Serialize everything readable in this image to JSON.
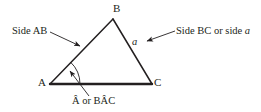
{
  "figure": {
    "name": "labelled-triangle-abc",
    "background_color": "#ffffff",
    "stroke_color": "#231f20",
    "vertices": {
      "a_label": "A",
      "b_label": "B",
      "c_label": "C"
    },
    "callouts": {
      "side_ab": "Side AB",
      "side_bc_prefix": "Side BC or side ",
      "side_bc_variable": "a",
      "side_variable_marker": "a",
      "angle_a_prefix": "Â",
      "angle_a_conjunction": " or ",
      "angle_a_full": "BÂC",
      "angle_a_text": "Â or BÂC"
    },
    "geometry": {
      "point_a": [
        50,
        84
      ],
      "point_b": [
        113,
        19
      ],
      "point_c": [
        152,
        84
      ],
      "arrow_side_ab_from": [
        58,
        33
      ],
      "arrow_side_ab_to": [
        82,
        47
      ],
      "arrow_side_bc_from": [
        175,
        31
      ],
      "arrow_side_bc_to": [
        145,
        42
      ],
      "arrow_angle_from": [
        88,
        95
      ],
      "arrow_angle_to": [
        68,
        70
      ],
      "angle_arc_radius": 30
    }
  }
}
